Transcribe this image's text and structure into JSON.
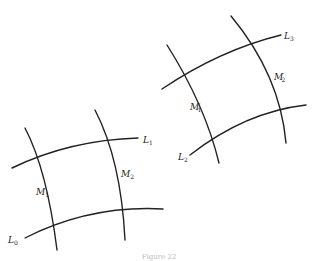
{
  "figure": {
    "left_grid": {
      "curves": {
        "L0": {
          "label": "L",
          "sub": "0"
        },
        "L1": {
          "label": "L",
          "sub": "1"
        },
        "M1": {
          "label": "M",
          "sub": "1"
        },
        "M2": {
          "label": "M",
          "sub": "2"
        }
      }
    },
    "right_grid": {
      "curves": {
        "L2": {
          "label": "L",
          "sub": "2"
        },
        "L3": {
          "label": "L",
          "sub": "3"
        },
        "M1p": {
          "label": "M",
          "sub": "1",
          "prime": "′"
        },
        "M2p": {
          "label": "M",
          "sub": "2",
          "prime": "′"
        }
      }
    },
    "caption": "Figure 22"
  }
}
